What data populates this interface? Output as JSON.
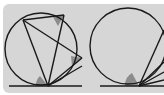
{
  "diagram": {
    "type": "geometry",
    "colors": {
      "background": "#d6d6d6",
      "stroke": "#1a1a1a",
      "shade": "#8c8c8c"
    },
    "figures": [
      {
        "name": "figure-left",
        "circle": {
          "cx": 41,
          "cy": 49,
          "r": 36
        },
        "tangent_line": {
          "x1": 9,
          "y1": 86,
          "x2": 82,
          "y2": 86
        },
        "tangent_point": {
          "x": 48,
          "y": 86
        },
        "points": [
          {
            "x": 23,
            "y": 20
          },
          {
            "x": 64,
            "y": 15
          },
          {
            "x": 82,
            "y": 58
          }
        ],
        "shaded_angles": 3
      },
      {
        "name": "figure-right",
        "circle": {
          "cx": 128,
          "cy": 46,
          "r": 38
        },
        "tangent_line": {
          "x1": 100,
          "y1": 86,
          "x2": 164,
          "y2": 86
        },
        "tangent_point": {
          "x": 139,
          "y": 86
        },
        "shaded_angles": 1
      }
    ]
  }
}
